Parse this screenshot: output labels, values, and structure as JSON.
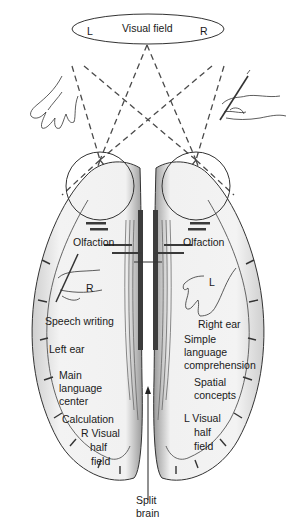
{
  "figure": {
    "visual_field": {
      "label": "Visual field",
      "left": "L",
      "right": "R"
    },
    "left_hemisphere": {
      "hand_marker": "R",
      "labels": {
        "olfaction": "Olfaction",
        "speech_writing": "Speech writing",
        "ear": "Left ear",
        "language_1": "Main",
        "language_2": "language",
        "language_3": "center",
        "calculation": "Calculation",
        "visual_1": "R Visual",
        "visual_2": "half",
        "visual_3": "field"
      }
    },
    "right_hemisphere": {
      "hand_marker": "L",
      "labels": {
        "olfaction": "Olfaction",
        "ear": "Right ear",
        "comprehension_1": "Simple",
        "comprehension_2": "language",
        "comprehension_3": "comprehension",
        "spatial_1": "Spatial",
        "spatial_2": "concepts",
        "visual_1": "L Visual",
        "visual_2": "half",
        "visual_3": "field"
      }
    },
    "center": {
      "label_1": "Split",
      "label_2": "brain"
    },
    "colors": {
      "ink": "#1a1a1a",
      "dash": "#555555",
      "shade": "#d9d9d9",
      "paper": "#ffffff"
    }
  }
}
